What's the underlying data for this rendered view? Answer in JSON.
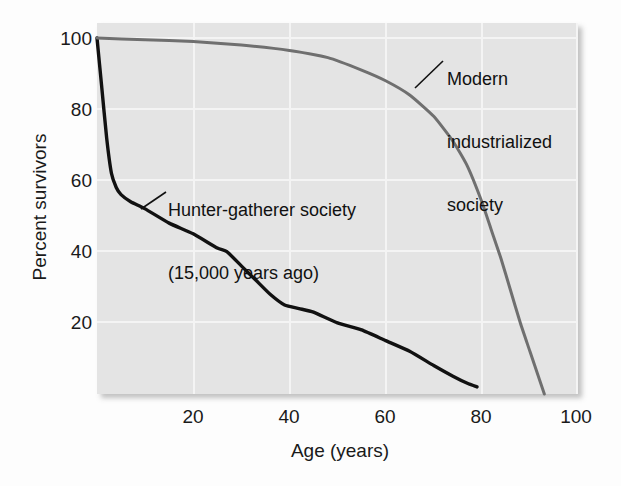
{
  "chart_data": {
    "type": "line",
    "title": "",
    "xlabel": "Age (years)",
    "ylabel": "Percent survivors",
    "xlim": [
      0,
      100
    ],
    "ylim": [
      0,
      100
    ],
    "xticks": [
      20,
      40,
      60,
      80,
      100
    ],
    "yticks": [
      20,
      40,
      60,
      80,
      100
    ],
    "xtick_labels": [
      "20",
      "40",
      "60",
      "80",
      "100"
    ],
    "ytick_labels": [
      "20",
      "40",
      "60",
      "80",
      "100"
    ],
    "grid": true,
    "legend_position": "inline-annotations",
    "plot_background": "#e4e4e4",
    "gridline_color": "#f4f4f4",
    "series": [
      {
        "name": "Hunter-gatherer society (15,000 years ago)",
        "color": "#111111",
        "line_width": 3.4,
        "x": [
          0,
          1,
          2,
          3,
          4,
          5,
          7,
          10,
          15,
          20,
          25,
          27,
          30,
          33,
          36,
          39,
          42,
          45,
          50,
          55,
          60,
          65,
          70,
          74,
          77,
          79
        ],
        "y": [
          100,
          86,
          72,
          62,
          58,
          56,
          54,
          52,
          48,
          45,
          41,
          40,
          36,
          32,
          28,
          25,
          24,
          23,
          20,
          18,
          15,
          12,
          8,
          5,
          3,
          2
        ]
      },
      {
        "name": "Modern industrialized society",
        "color": "#6f6f6f",
        "line_width": 3.0,
        "x": [
          0,
          10,
          20,
          30,
          40,
          48,
          55,
          60,
          65,
          70,
          74,
          77,
          80,
          82,
          84,
          86,
          88,
          90,
          92,
          93
        ],
        "y": [
          100,
          99.5,
          99,
          98,
          96.5,
          94.5,
          91,
          88,
          84,
          78,
          71,
          64,
          54,
          46,
          38,
          29,
          20,
          12,
          4,
          0
        ]
      }
    ],
    "annotations": [
      {
        "id": "hunter-gatherer",
        "lines": [
          "Hunter-gatherer society",
          "(15,000 years ago)"
        ],
        "text_x": 168,
        "text_y": 158,
        "leader_from": [
          166,
          192
        ],
        "leader_to": [
          141,
          209
        ]
      },
      {
        "id": "modern-industrialized",
        "lines": [
          "Modern",
          "industrialized",
          "society"
        ],
        "text_x": 447,
        "text_y": 27,
        "leader_from": [
          443,
          61
        ],
        "leader_to": [
          415,
          88
        ]
      }
    ]
  },
  "axes": {
    "y_title": "Percent survivors",
    "x_title": "Age (years)",
    "y_ticks": [
      {
        "label": "100",
        "value": 100
      },
      {
        "label": "80",
        "value": 80
      },
      {
        "label": "60",
        "value": 60
      },
      {
        "label": "40",
        "value": 40
      },
      {
        "label": "20",
        "value": 20
      }
    ],
    "x_ticks": [
      {
        "label": "20",
        "value": 20
      },
      {
        "label": "40",
        "value": 40
      },
      {
        "label": "60",
        "value": 60
      },
      {
        "label": "80",
        "value": 80
      },
      {
        "label": "100",
        "value": 100
      }
    ]
  },
  "annotation_text": {
    "hunter_line1": "Hunter-gatherer society",
    "hunter_line2": "(15,000 years ago)",
    "modern_line1": "Modern",
    "modern_line2": "industrialized",
    "modern_line3": "society"
  }
}
